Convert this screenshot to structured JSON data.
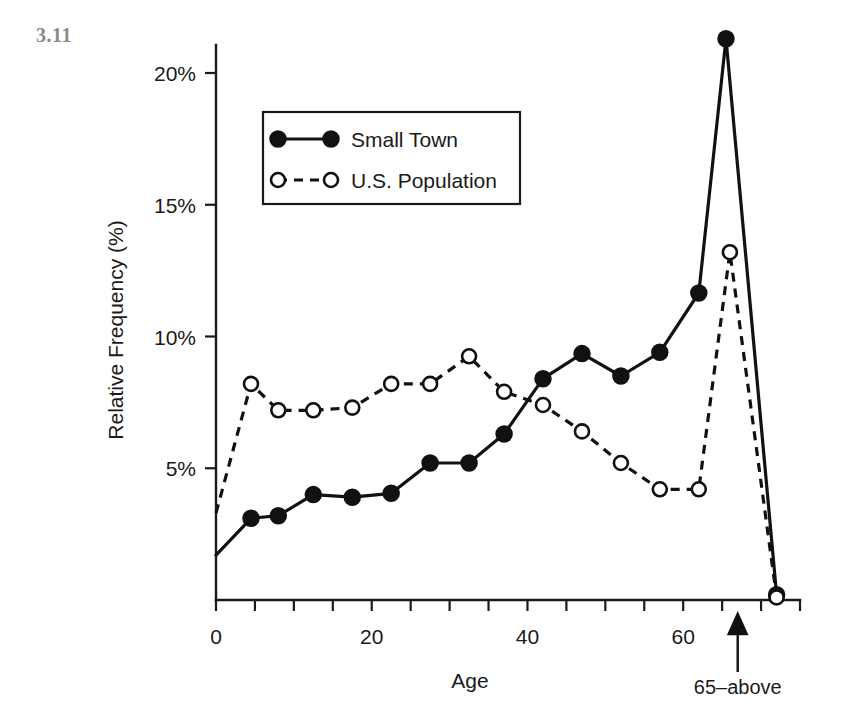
{
  "figure": {
    "number": "3.11"
  },
  "chart_data": {
    "type": "line",
    "title": "",
    "xlabel": "Age",
    "ylabel": "Relative Frequency (%)",
    "xlim": [
      0,
      75
    ],
    "ylim": [
      0,
      22
    ],
    "grid": false,
    "legend_position": "upper-left-inside",
    "x_ticks_major": [
      0,
      20,
      40,
      60
    ],
    "x_tick_labels": [
      "0",
      "20",
      "40",
      "60"
    ],
    "x_tick_minor_step": 5,
    "y_ticks": [
      5,
      10,
      15,
      20
    ],
    "y_tick_labels": [
      "5%",
      "10%",
      "15%",
      "20%"
    ],
    "annotations": [
      {
        "text": "65–above",
        "x": 67,
        "points_to_x": 67,
        "points_to_y": 0
      }
    ],
    "series": [
      {
        "name": "Small Town",
        "marker": "filled-circle",
        "line_style": "solid",
        "color": "#111111",
        "x": [
          0,
          4.5,
          8,
          12.5,
          17.5,
          22.5,
          27.5,
          32.5,
          37,
          42,
          47,
          52,
          57,
          62,
          65.5,
          72
        ],
        "values": [
          1.7,
          3.1,
          3.2,
          4.0,
          3.9,
          4.05,
          5.2,
          5.2,
          6.3,
          8.4,
          9.35,
          8.5,
          9.4,
          11.65,
          21.3,
          0.2
        ]
      },
      {
        "name": "U.S. Population",
        "marker": "open-circle",
        "line_style": "dashed",
        "color": "#111111",
        "x": [
          0,
          4.5,
          8,
          12.5,
          17.5,
          22.5,
          27.5,
          32.5,
          37,
          42,
          47,
          52,
          57,
          62,
          66,
          72
        ],
        "values": [
          3.3,
          8.2,
          7.2,
          7.2,
          7.3,
          8.2,
          8.2,
          9.25,
          7.9,
          7.4,
          6.4,
          5.2,
          4.2,
          4.2,
          13.2,
          0.1
        ]
      }
    ]
  },
  "legend": {
    "entries": [
      {
        "label": "Small Town",
        "style": "solid-filled"
      },
      {
        "label": "U.S. Population",
        "style": "dashed-open"
      }
    ]
  }
}
